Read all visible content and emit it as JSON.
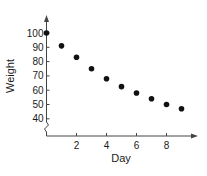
{
  "chart_data": {
    "type": "scatter",
    "title": "",
    "xlabel": "Day",
    "ylabel": "Weight",
    "x": [
      0,
      1,
      2,
      3,
      4,
      5,
      6,
      7,
      8,
      9
    ],
    "series": [
      {
        "name": "Weight",
        "values": [
          100,
          91,
          83,
          75,
          68,
          62.5,
          58,
          54,
          50,
          47
        ]
      }
    ],
    "xticks": [
      2,
      4,
      6,
      8
    ],
    "yticks": [
      40,
      50,
      60,
      70,
      80,
      90,
      100
    ],
    "xlim": [
      0,
      10
    ],
    "ylim": [
      30,
      105
    ],
    "y_axis_break": true,
    "grid": false,
    "legend": null,
    "colors": {
      "marker": "#111111",
      "axis": "#444444",
      "text": "#1a1a1a"
    }
  }
}
